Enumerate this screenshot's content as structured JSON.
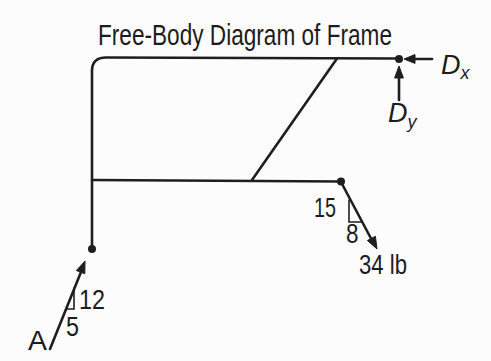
{
  "title": "Free-Body Diagram of Frame",
  "colors": {
    "ink": "#1e1e1e",
    "background": "#fcfcfc"
  },
  "labels": {
    "dx": {
      "symbol": "D",
      "subscript": "x"
    },
    "dy": {
      "symbol": "D",
      "subscript": "y"
    },
    "applied_force": {
      "magnitude": "34 lb",
      "slope_rise": "15",
      "slope_run": "8"
    },
    "support_reaction": {
      "point": "A",
      "slope_rise": "12",
      "slope_run": "5"
    }
  }
}
